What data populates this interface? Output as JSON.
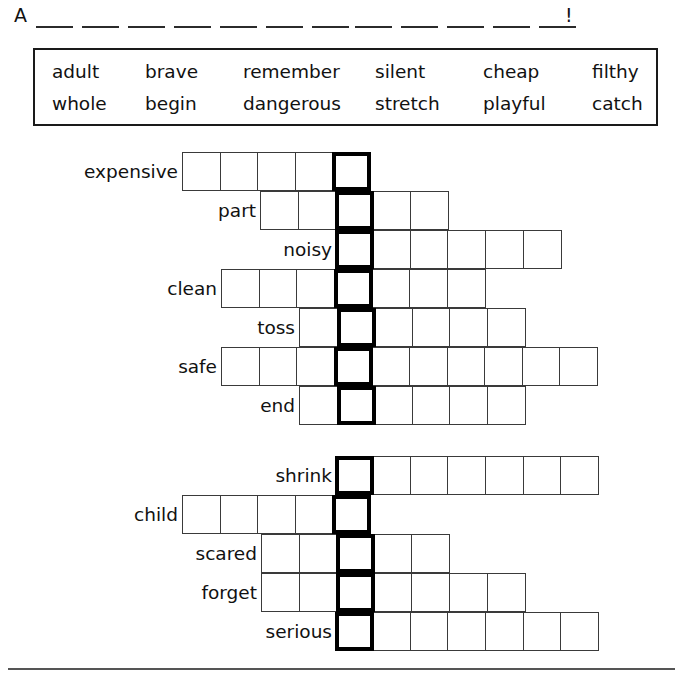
{
  "answer_line": {
    "prefix": "A",
    "group1_blanks": 7,
    "group2_blanks": 5,
    "terminator": "!"
  },
  "word_bank": {
    "rows": [
      [
        "adult",
        "brave",
        "remember",
        "silent",
        "cheap",
        "filthy"
      ],
      [
        "whole",
        "begin",
        "dangerous",
        "stretch",
        "playful",
        "catch"
      ]
    ]
  },
  "puzzles": [
    {
      "name": "puzzle-top",
      "rows": [
        {
          "label": "expensive",
          "label_right": 178,
          "start_x": 182,
          "left_cells": 4,
          "right_cells": 0
        },
        {
          "label": "part",
          "label_right": 256,
          "start_x": 260,
          "left_cells": 2,
          "right_cells": 2
        },
        {
          "label": "noisy",
          "label_right": 332,
          "start_x": 336,
          "left_cells": 0,
          "right_cells": 5
        },
        {
          "label": "clean",
          "label_right": 217,
          "start_x": 221,
          "left_cells": 3,
          "right_cells": 3
        },
        {
          "label": "toss",
          "label_right": 295,
          "start_x": 299,
          "left_cells": 1,
          "right_cells": 4
        },
        {
          "label": "safe",
          "label_right": 217,
          "start_x": 221,
          "left_cells": 3,
          "right_cells": 6
        },
        {
          "label": "end",
          "label_right": 295,
          "start_x": 299,
          "left_cells": 1,
          "right_cells": 4
        }
      ]
    },
    {
      "name": "puzzle-bottom",
      "rows": [
        {
          "label": "shrink",
          "label_right": 332,
          "start_x": 336,
          "left_cells": 0,
          "right_cells": 6
        },
        {
          "label": "child",
          "label_right": 178,
          "start_x": 182,
          "left_cells": 4,
          "right_cells": 0
        },
        {
          "label": "scared",
          "label_right": 257,
          "start_x": 261,
          "left_cells": 2,
          "right_cells": 2
        },
        {
          "label": "forget",
          "label_right": 257,
          "start_x": 261,
          "left_cells": 2,
          "right_cells": 4
        },
        {
          "label": "serious",
          "label_right": 332,
          "start_x": 336,
          "left_cells": 0,
          "right_cells": 6
        }
      ]
    }
  ],
  "colors": {
    "ink": "#111111",
    "cell_border": "#3a3a3a",
    "key_border": "#000000",
    "box_border": "#1a1a1a",
    "rule": "#555555"
  }
}
